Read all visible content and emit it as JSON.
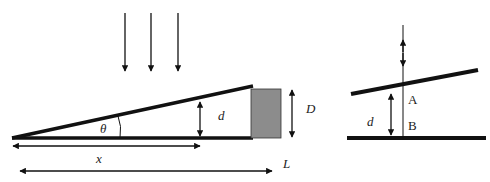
{
  "labels": {
    "theta": "θ",
    "d_left": "d",
    "D": "D",
    "x": "x",
    "L": "L",
    "d_right": "d",
    "A": "A",
    "B": "B"
  },
  "colors": {
    "line": "#111111",
    "spacer": "#8c8c8c"
  }
}
